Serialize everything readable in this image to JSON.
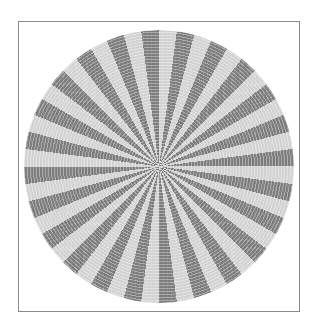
{
  "figure": {
    "type": "radial-stripe-pattern",
    "sector_count": 48,
    "dark_sector_count": 24,
    "light_sector_count": 24,
    "sector_angle_deg": 7.5,
    "colors": {
      "dark": "#7c7c7c",
      "light": "#d2d2d2",
      "frame_border": "#8a8a8a",
      "background": "#ffffff"
    }
  }
}
